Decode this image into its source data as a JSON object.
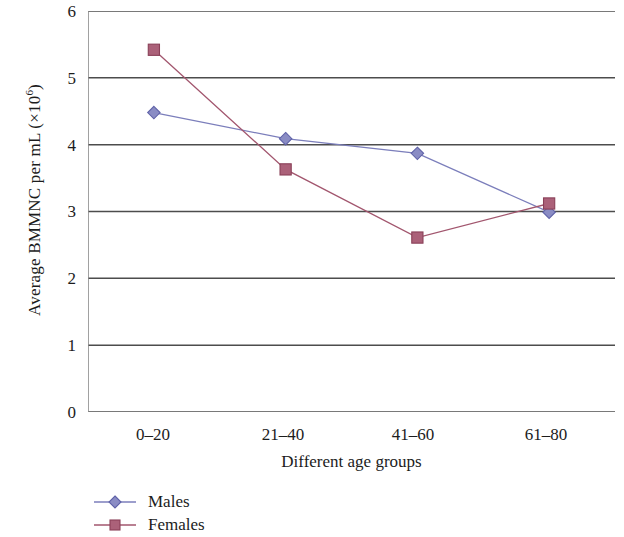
{
  "chart_data": {
    "type": "line",
    "title": "",
    "xlabel": "Different age groups",
    "ylabel": "Average BMMNC per mL (×10⁶)",
    "ylabel_base": "Average BMMNC per mL (×10",
    "ylabel_exponent": "6",
    "ylabel_close": ")",
    "categories": [
      "0–20",
      "21–40",
      "41–60",
      "61–80"
    ],
    "series": [
      {
        "name": "Males",
        "values": [
          4.48,
          4.09,
          3.87,
          2.99
        ],
        "color": "#7b7ebb",
        "marker": "diamond"
      },
      {
        "name": "Females",
        "values": [
          5.42,
          3.63,
          2.61,
          3.12
        ],
        "color": "#a2566e",
        "marker": "square"
      }
    ],
    "ylim": [
      0,
      6
    ],
    "y_ticks": [
      6,
      5,
      4,
      3,
      2,
      1,
      0
    ],
    "y_tick_labels": [
      "6",
      "5",
      "4",
      "3",
      "2",
      "1",
      "0"
    ],
    "grid": true,
    "grid_axis": "y",
    "grid_color": "#4d4d4d",
    "axis_color": "#4d4d4d",
    "legend_position": "bottom-left",
    "legend": [
      "Males",
      "Females"
    ]
  }
}
